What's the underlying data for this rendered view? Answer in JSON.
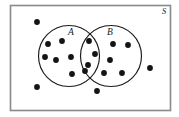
{
  "figure": {
    "kind": "venn-diagram",
    "background_color": "#ffffff",
    "frame_color": "#8a8a8a",
    "ink_color": "#1a1a1a",
    "dot_color": "#141414"
  },
  "universe": {
    "label": "S",
    "label_x": 164,
    "label_y": 13,
    "x": 10.5,
    "y": 5.5,
    "width": 160,
    "height": 105
  },
  "sets": [
    {
      "id": "A",
      "label": "A",
      "cx": 69,
      "cy": 56,
      "r": 30.5,
      "label_x": 71,
      "label_y": 33
    },
    {
      "id": "B",
      "label": "B",
      "cx": 111,
      "cy": 56,
      "r": 30.5,
      "label_x": 110,
      "label_y": 33
    }
  ],
  "dots": {
    "radius": 2.9,
    "outside_only": [
      {
        "x": 37,
        "y": 22
      },
      {
        "x": 37,
        "y": 87
      },
      {
        "x": 97,
        "y": 91
      },
      {
        "x": 150,
        "y": 68
      }
    ],
    "set_a_only": [
      {
        "x": 48,
        "y": 43
      },
      {
        "x": 61,
        "y": 41
      },
      {
        "x": 56,
        "y": 59
      },
      {
        "x": 71,
        "y": 57
      },
      {
        "x": 72,
        "y": 73
      },
      {
        "x": 48,
        "y": 44
      }
    ],
    "intersection": [
      {
        "x": 89,
        "y": 41
      },
      {
        "x": 95,
        "y": 54
      },
      {
        "x": 88,
        "y": 64
      },
      {
        "x": 85,
        "y": 70
      }
    ],
    "set_b_only": [
      {
        "x": 127,
        "y": 45
      },
      {
        "x": 111,
        "y": 58
      },
      {
        "x": 104,
        "y": 72
      },
      {
        "x": 122,
        "y": 72
      },
      {
        "x": 112,
        "y": 60
      }
    ]
  },
  "counts": {
    "set_a_only": 6,
    "intersection": 4,
    "set_b_only": 5,
    "outside": 4,
    "total": 19
  }
}
